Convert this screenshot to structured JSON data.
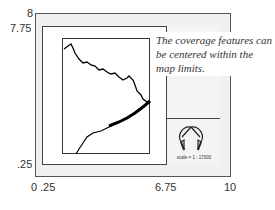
{
  "axes": {
    "y_labels": [
      {
        "text": "8",
        "value": 8
      },
      {
        "text": "7.75",
        "value": 7.75
      },
      {
        "text": ".25",
        "value": 0.25
      }
    ],
    "x_labels": [
      {
        "text": "0",
        "value": 0
      },
      {
        "text": ".25",
        "value": 0.25
      },
      {
        "text": "6.75",
        "value": 6.75
      },
      {
        "text": "10",
        "value": 10
      }
    ]
  },
  "callout": {
    "text": "The coverage features can be centered within the map limits."
  },
  "legend_panel": {
    "scale_text": "scale = 1 : 17000",
    "north_arrow_icon": "north-arrow-icon"
  },
  "colors": {
    "frame_stroke": "#444444",
    "page_fill": "#f0f0f0",
    "feature_stroke": "#000000"
  }
}
